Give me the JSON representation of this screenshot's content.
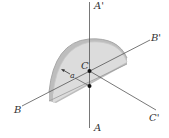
{
  "diagram": {
    "type": "3d-geometry",
    "labels": {
      "a_prime": "A'",
      "a": "A",
      "b_prime": "B'",
      "b": "B",
      "c_prime": "C'",
      "c": "C",
      "radius": "a"
    },
    "colors": {
      "plate_face": "#d9d9d9",
      "plate_edge": "#bdbdbd",
      "axis": "#555555",
      "point": "#111111"
    }
  }
}
